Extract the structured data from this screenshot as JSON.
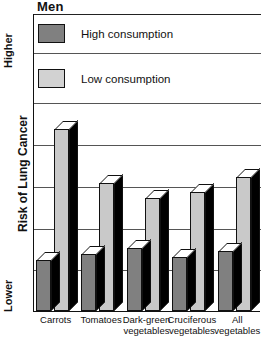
{
  "chart_data": {
    "type": "bar",
    "title": "Men",
    "xlabel": "",
    "ylabel": "Risk of Lung Cancer",
    "axis_high_label": "Higher",
    "axis_low_label": "Lower",
    "grid": true,
    "legend_position": "top-left",
    "ylim": [
      0,
      100
    ],
    "gridline_values": [
      100,
      87,
      70,
      56,
      42,
      28,
      14
    ],
    "categories": [
      "Carrots",
      "Tomatoes",
      "Dark-green\nvegetables",
      "Cruciferous\nvegetables",
      "All\nvegetables"
    ],
    "series": [
      {
        "name": "High consumption",
        "color": "#808080",
        "values": [
          17,
          19,
          21,
          18,
          20
        ]
      },
      {
        "name": "Low consumption",
        "color": "#c9c9c9",
        "values": [
          61,
          43,
          38,
          40,
          45
        ]
      }
    ]
  },
  "legend": {
    "high_label": "High consumption",
    "low_label": "Low consumption"
  }
}
